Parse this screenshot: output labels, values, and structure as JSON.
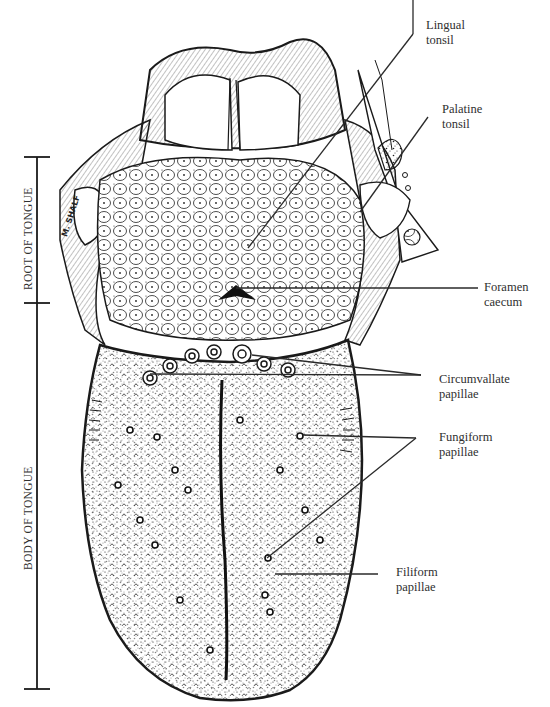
{
  "figure": {
    "signature": "M. SHALF"
  },
  "brackets": [
    {
      "id": "root",
      "label": "ROOT OF TONGUE",
      "top": 157,
      "bottom": 303
    },
    {
      "id": "body",
      "label": "BODY OF TONGUE",
      "top": 303,
      "bottom": 689
    }
  ],
  "labels": [
    {
      "id": "lingual-tonsil",
      "line1": "Lingual",
      "line2": "tonsil",
      "x": 426,
      "y": 18
    },
    {
      "id": "palatine-tonsil",
      "line1": "Palatine",
      "line2": "tonsil",
      "x": 442,
      "y": 102
    },
    {
      "id": "foramen-caecum",
      "line1": "Foramen",
      "line2": "caecum",
      "x": 484,
      "y": 280
    },
    {
      "id": "circumvallate-papillae",
      "line1": "Circumvallate",
      "line2": "papillae",
      "x": 439,
      "y": 372
    },
    {
      "id": "fungiform-papillae",
      "line1": "Fungiform",
      "line2": "papillae",
      "x": 439,
      "y": 430
    },
    {
      "id": "filiform-papillae",
      "line1": "Filiform",
      "line2": "papillae",
      "x": 396,
      "y": 565
    }
  ],
  "colors": {
    "ink": "#1a1a1a",
    "text": "#2f2f2f",
    "paper": "#ffffff"
  }
}
